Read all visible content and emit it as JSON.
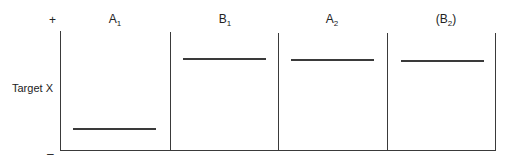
{
  "diagram": {
    "y_axis": {
      "label": "Target X",
      "top_marker": "+",
      "bottom_marker": "–"
    },
    "phases": [
      {
        "letter": "A",
        "subscript": "1",
        "prefix": "",
        "suffix": "",
        "level": "low"
      },
      {
        "letter": "B",
        "subscript": "1",
        "prefix": "",
        "suffix": "",
        "level": "high"
      },
      {
        "letter": "A",
        "subscript": "2",
        "prefix": "",
        "suffix": "",
        "level": "high"
      },
      {
        "letter": "B",
        "subscript": "2",
        "prefix": "(",
        "suffix": ")",
        "level": "high"
      }
    ],
    "line_color": "#3a3a3a"
  }
}
